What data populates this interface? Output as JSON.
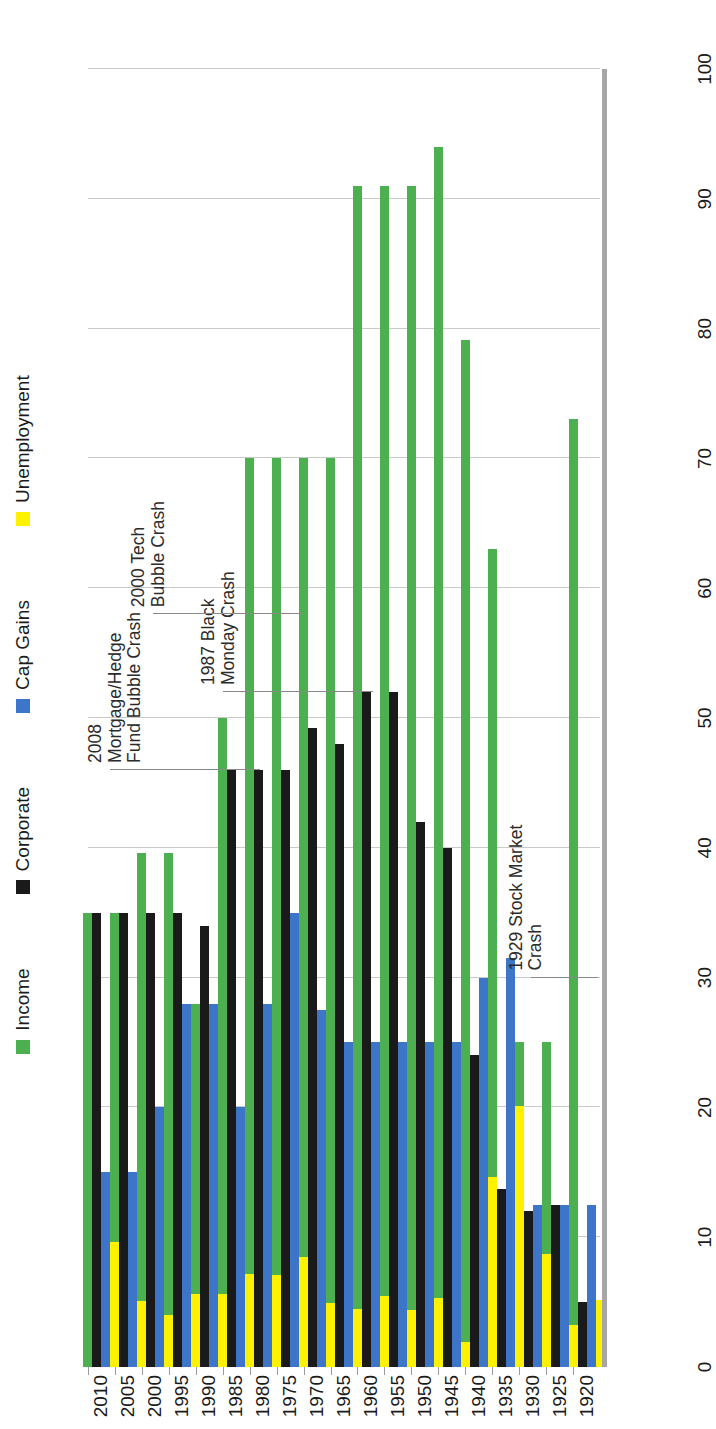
{
  "chart_data": {
    "type": "bar",
    "orientation": "vertical-rotated",
    "title": "",
    "xlabel": "",
    "ylabel": "",
    "ylim": [
      0,
      100
    ],
    "y_ticks": [
      0,
      10,
      20,
      30,
      40,
      50,
      60,
      70,
      80,
      90,
      100
    ],
    "grid": true,
    "legend_position": "top",
    "categories": [
      "1920",
      "1925",
      "1930",
      "1935",
      "1940",
      "1945",
      "1950",
      "1955",
      "1960",
      "1965",
      "1970",
      "1975",
      "1980",
      "1985",
      "1990",
      "1995",
      "2000",
      "2005",
      "2010"
    ],
    "series": [
      {
        "name": "Income",
        "color": "#4caf50",
        "values": [
          73,
          25,
          25,
          63,
          79.1,
          94,
          91,
          91,
          91,
          70,
          70,
          70,
          70,
          50,
          28,
          39.6,
          39.6,
          35,
          35
        ]
      },
      {
        "name": "Corporate",
        "color": "#1a1a1a",
        "values": [
          5,
          12.5,
          12,
          13.75,
          24,
          40,
          42,
          52,
          52,
          48,
          49.2,
          46,
          46,
          46,
          34,
          35,
          35,
          35,
          35
        ]
      },
      {
        "name": "Cap Gains",
        "color": "#3d76c9",
        "values": [
          12.5,
          12.5,
          12.5,
          31.5,
          30,
          25,
          25,
          25,
          25,
          25,
          27.5,
          35,
          28,
          20,
          28,
          28,
          20,
          15,
          15
        ]
      },
      {
        "name": "Unemployment",
        "color": "#fff200",
        "values": [
          5.2,
          3.2,
          8.7,
          20.1,
          14.6,
          1.9,
          5.3,
          4.4,
          5.5,
          4.5,
          4.9,
          8.5,
          7.1,
          7.2,
          5.6,
          5.6,
          4.0,
          5.1,
          9.6
        ]
      }
    ],
    "annotations": [
      {
        "text": "1929 Stock Market\nCrash",
        "category": "1930",
        "value": 30
      },
      {
        "text": "1987 Black\nMonday Crash",
        "category": "1987",
        "value": 52
      },
      {
        "text": "2000 Tech\nBubble Crash",
        "category": "2000",
        "value": 58
      },
      {
        "text": "2008\nMortgage/Hedge\nFund Bubble Crash",
        "category": "2008",
        "value": 46
      }
    ]
  },
  "legend": {
    "items": [
      {
        "label": "Income",
        "color": "#4caf50"
      },
      {
        "label": "Corporate",
        "color": "#1a1a1a"
      },
      {
        "label": "Cap Gains",
        "color": "#3d76c9"
      },
      {
        "label": "Unemployment",
        "color": "#fff200"
      }
    ]
  }
}
